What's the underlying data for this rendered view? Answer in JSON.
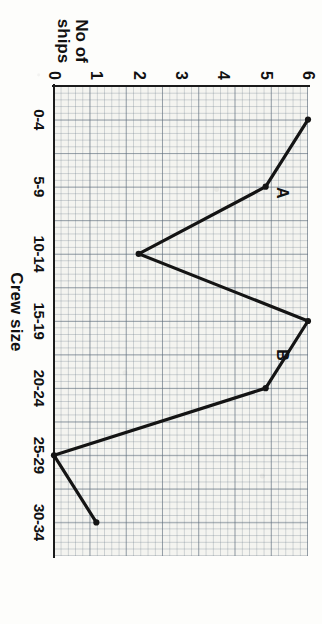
{
  "chart_data": {
    "type": "line",
    "title": "",
    "xlabel": "Crew size",
    "ylabel": "No of ships",
    "ylabel_line1": "No of",
    "ylabel_line2": "ships",
    "categories": [
      "0-4",
      "5-9",
      "10-14",
      "15-19",
      "20-24",
      "25-29",
      "30-34"
    ],
    "values": [
      6,
      5,
      2,
      6,
      5,
      0,
      1
    ],
    "ylim": [
      0,
      6
    ],
    "yticks": [
      "0",
      "1",
      "2",
      "3",
      "4",
      "5",
      "6"
    ],
    "ytick_values": [
      0,
      1,
      2,
      3,
      4,
      5,
      6
    ],
    "grid": true,
    "grid_style": "graph-paper",
    "legend": "none",
    "annotations": [
      {
        "text": "A",
        "category": "5-9",
        "value": 5,
        "dx": 6,
        "dy": -16
      },
      {
        "text": "B",
        "category": "15-19",
        "value": 6,
        "dx": 34,
        "dy": 26
      }
    ],
    "series": [
      {
        "name": "ships",
        "values": [
          6,
          5,
          2,
          6,
          5,
          0,
          1
        ]
      }
    ]
  },
  "style": {
    "line_color": "#141414",
    "marker_color": "#141414",
    "axis_color": "#1a1a1a",
    "grid_color": "#5a6978",
    "paper_color": "#f4f4f0",
    "page_color": "#fdfdfb",
    "text_color": "#111111"
  }
}
